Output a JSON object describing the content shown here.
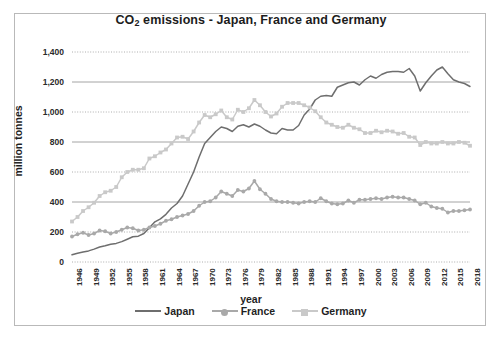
{
  "chart_data": {
    "type": "line",
    "title": "CO2 emissions - Japan, France and Germany",
    "title_main": "CO",
    "title_sub": "2",
    "title_rest": " emissions - Japan, France and Germany",
    "xlabel": "year",
    "ylabel": "million tonnes",
    "ylim": [
      0,
      1400
    ],
    "ytick_values": [
      0,
      200,
      400,
      600,
      800,
      1000,
      1200,
      1400
    ],
    "ytick_labels": [
      "0",
      "200",
      "400",
      "600",
      "800",
      "1,000",
      "1,200",
      "1,400"
    ],
    "grid": true,
    "legend_position": "bottom",
    "xlim": [
      1946,
      2018
    ],
    "xtick_labels": [
      "1946",
      "1949",
      "1952",
      "1955",
      "1958",
      "1961",
      "1964",
      "1967",
      "1970",
      "1973",
      "1976",
      "1979",
      "1982",
      "1985",
      "1988",
      "1991",
      "1994",
      "1997",
      "2000",
      "2003",
      "2006",
      "2009",
      "2012",
      "2015",
      "2018"
    ],
    "x": [
      1946,
      1947,
      1948,
      1949,
      1950,
      1951,
      1952,
      1953,
      1954,
      1955,
      1956,
      1957,
      1958,
      1959,
      1960,
      1961,
      1962,
      1963,
      1964,
      1965,
      1966,
      1967,
      1968,
      1969,
      1970,
      1971,
      1972,
      1973,
      1974,
      1975,
      1976,
      1977,
      1978,
      1979,
      1980,
      1981,
      1982,
      1983,
      1984,
      1985,
      1986,
      1987,
      1988,
      1989,
      1990,
      1991,
      1992,
      1993,
      1994,
      1995,
      1996,
      1997,
      1998,
      1999,
      2000,
      2001,
      2002,
      2003,
      2004,
      2005,
      2006,
      2007,
      2008,
      2009,
      2010,
      2011,
      2012,
      2013,
      2014,
      2015,
      2016,
      2017,
      2018
    ],
    "series": [
      {
        "name": "Japan",
        "color": "#6e6e6e",
        "marker": "none",
        "values": [
          48,
          58,
          66,
          74,
          86,
          100,
          108,
          118,
          124,
          136,
          152,
          168,
          172,
          190,
          228,
          268,
          288,
          318,
          360,
          390,
          440,
          520,
          600,
          700,
          790,
          830,
          870,
          900,
          890,
          870,
          905,
          915,
          900,
          920,
          905,
          880,
          860,
          855,
          890,
          880,
          880,
          910,
          980,
          1020,
          1080,
          1105,
          1110,
          1105,
          1165,
          1180,
          1195,
          1200,
          1180,
          1215,
          1240,
          1225,
          1250,
          1265,
          1270,
          1270,
          1265,
          1290,
          1240,
          1140,
          1195,
          1240,
          1280,
          1300,
          1255,
          1215,
          1200,
          1190,
          1170
        ]
      },
      {
        "name": "France",
        "color": "#a9a9a9",
        "marker": "circle",
        "values": [
          170,
          185,
          195,
          180,
          190,
          210,
          205,
          190,
          200,
          215,
          230,
          225,
          210,
          215,
          230,
          240,
          255,
          275,
          285,
          300,
          310,
          320,
          340,
          375,
          400,
          405,
          430,
          470,
          455,
          440,
          480,
          470,
          490,
          540,
          485,
          455,
          420,
          405,
          400,
          400,
          395,
          390,
          400,
          405,
          400,
          425,
          405,
          390,
          385,
          390,
          410,
          395,
          415,
          415,
          420,
          425,
          420,
          430,
          435,
          430,
          430,
          420,
          410,
          385,
          395,
          370,
          360,
          355,
          330,
          340,
          340,
          345,
          350
        ]
      },
      {
        "name": "Germany",
        "color": "#c9c9c9",
        "marker": "square",
        "values": [
          270,
          300,
          340,
          365,
          395,
          440,
          465,
          475,
          500,
          565,
          600,
          615,
          615,
          625,
          690,
          705,
          730,
          750,
          790,
          830,
          835,
          820,
          870,
          930,
          980,
          965,
          985,
          1010,
          965,
          950,
          1015,
          1000,
          1025,
          1080,
          1045,
          1000,
          970,
          990,
          1035,
          1060,
          1060,
          1060,
          1045,
          1030,
          1005,
          965,
          930,
          915,
          900,
          895,
          915,
          895,
          885,
          860,
          860,
          875,
          865,
          875,
          870,
          855,
          860,
          835,
          830,
          780,
          800,
          790,
          790,
          800,
          790,
          790,
          800,
          795,
          775
        ]
      }
    ]
  }
}
